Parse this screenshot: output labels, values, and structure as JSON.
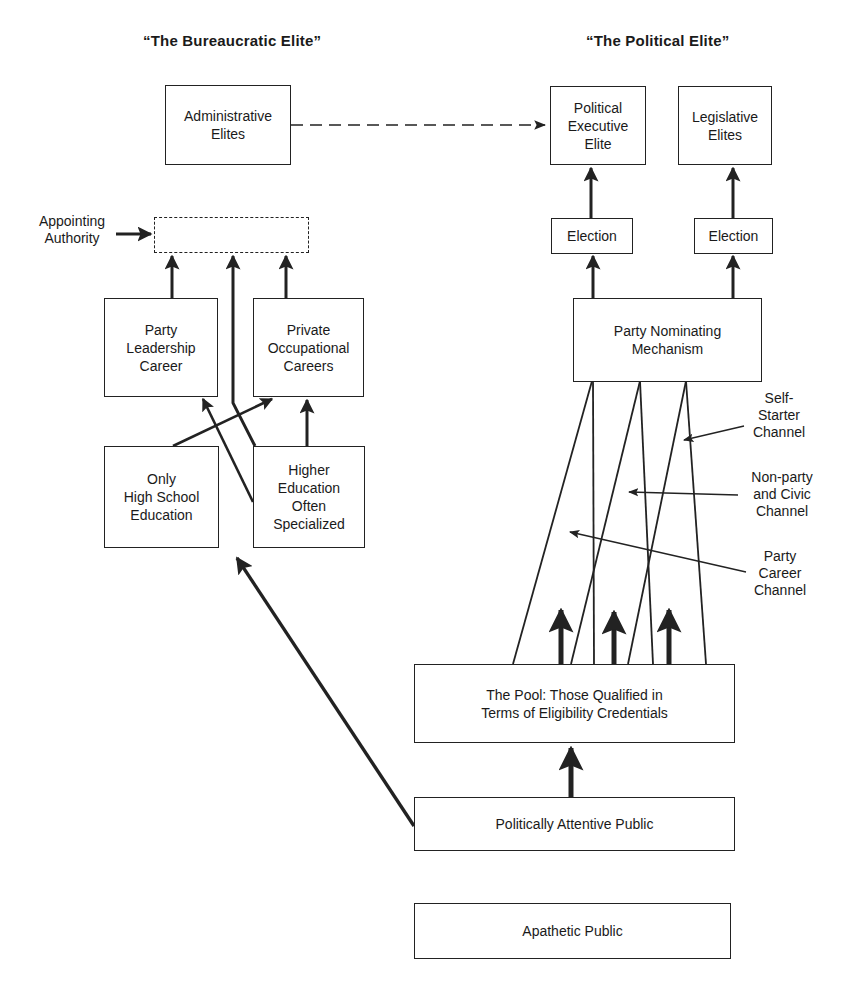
{
  "headings": {
    "bureaucratic": "“The Bureaucratic Elite”",
    "political": "“The Political Elite”"
  },
  "nodes": {
    "administrative_elites": "Administrative\nElites",
    "political_executive_elite": "Political\nExecutive\nElite",
    "legislative_elites": "Legislative\nElites",
    "election_executive": "Election",
    "election_legislative": "Election",
    "appointing_placeholder": "",
    "party_leadership_career": "Party\nLeadership\nCareer",
    "private_occupational_careers": "Private\nOccupational\nCareers",
    "only_high_school_education": "Only\nHigh School\nEducation",
    "higher_education_specialized": "Higher\nEducation\nOften\nSpecialized",
    "party_nominating_mechanism": "Party Nominating\nMechanism",
    "the_pool": "The Pool: Those Qualified in\nTerms of Eligibility Credentials",
    "politically_attentive_public": "Politically Attentive Public",
    "apathetic_public": "Apathetic Public"
  },
  "labels": {
    "appointing_authority": "Appointing\nAuthority",
    "self_starter_channel": "Self-\nStarter\nChannel",
    "nonparty_civic_channel": "Non-party\nand Civic\nChannel",
    "party_career_channel": "Party\nCareer\nChannel"
  },
  "colors": {
    "ink": "#222222",
    "background": "#ffffff"
  }
}
